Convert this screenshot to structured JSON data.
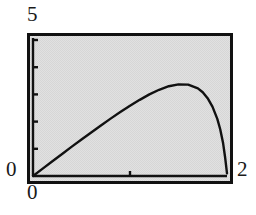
{
  "figure": {
    "background_color": "#ffffff",
    "panel_color": "#d6d6d6",
    "frame_color": "#111111",
    "curve_color": "#111111"
  },
  "labels": {
    "y_max": "5",
    "y_min": "0",
    "x_min": "0",
    "x_max": "2"
  },
  "chart_data": {
    "type": "line",
    "title": "",
    "xlabel": "",
    "ylabel": "",
    "xlim": [
      0,
      2
    ],
    "ylim": [
      0,
      5
    ],
    "xticks": [
      0,
      1,
      2
    ],
    "xtick_labels": [
      "0",
      "",
      "2"
    ],
    "yticks": [
      0,
      1,
      2,
      3,
      4,
      5
    ],
    "ytick_labels": [
      "0",
      "",
      "",
      "",
      "",
      "5"
    ],
    "grid": false,
    "legend": null,
    "axes_style": "framed-box-with-interior-ticks",
    "series": [
      {
        "name": "curve",
        "x": [
          0.0,
          0.1,
          0.2,
          0.3,
          0.4,
          0.5,
          0.6,
          0.7,
          0.8,
          0.9,
          1.0,
          1.1,
          1.2,
          1.3,
          1.4,
          1.5,
          1.6,
          1.7,
          1.75,
          1.8,
          1.85,
          1.9,
          1.93,
          1.96,
          1.98,
          2.0
        ],
        "y": [
          0.0,
          0.27,
          0.54,
          0.81,
          1.08,
          1.34,
          1.6,
          1.86,
          2.11,
          2.35,
          2.58,
          2.8,
          3.0,
          3.17,
          3.3,
          3.37,
          3.36,
          3.22,
          3.08,
          2.86,
          2.55,
          2.1,
          1.72,
          1.2,
          0.7,
          0.1
        ]
      }
    ]
  }
}
